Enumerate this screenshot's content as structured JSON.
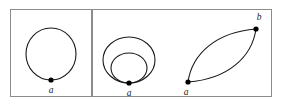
{
  "figure": {
    "title": "",
    "background_color": "#ffffff",
    "curve_color": "#1a1a1a",
    "frame_color": "#8c8c8c",
    "node_color": "#000000",
    "panels": [
      {
        "id": "panel-left",
        "description": "single closed loop based at a point",
        "frame": {
          "x": 10,
          "y": 9,
          "width": 82,
          "height": 88
        },
        "curves": [
          {
            "id": "loop-single",
            "type": "circle",
            "cx": 51,
            "cy": 54,
            "rx": 25,
            "ry": 26
          }
        ],
        "nodes": [
          {
            "id": "node-a-left",
            "label": "a",
            "x": 51,
            "y": 80,
            "radius": 2.6,
            "label_x": 51,
            "label_y": 93,
            "label_anchor": "middle"
          }
        ]
      },
      {
        "id": "panel-right",
        "description": "two tangent loops at a common base point, and a bigon between two points",
        "frame": {
          "x": 92,
          "y": 9,
          "width": 180,
          "height": 88
        },
        "curves": [
          {
            "id": "loop-outer",
            "type": "circle",
            "cx": 129,
            "cy": 60,
            "rx": 26,
            "ry": 23
          },
          {
            "id": "loop-inner",
            "type": "circle",
            "cx": 129,
            "cy": 68,
            "rx": 18,
            "ry": 15
          },
          {
            "id": "bigon-arc-upper",
            "type": "arc",
            "from": {
              "x": 188,
              "y": 82
            },
            "to": {
              "x": 256,
              "y": 29
            },
            "bulge": "upper-left"
          },
          {
            "id": "bigon-arc-lower",
            "type": "arc",
            "from": {
              "x": 188,
              "y": 82
            },
            "to": {
              "x": 256,
              "y": 29
            },
            "bulge": "lower-right"
          }
        ],
        "nodes": [
          {
            "id": "node-a-tangent",
            "label": "a",
            "x": 129,
            "y": 83,
            "radius": 2.6,
            "label_x": 129,
            "label_y": 96,
            "label_anchor": "middle"
          },
          {
            "id": "node-a-bigon",
            "label": "a",
            "x": 188,
            "y": 82,
            "radius": 2.6,
            "label_x": 186,
            "label_y": 95,
            "label_anchor": "middle"
          },
          {
            "id": "node-b-bigon",
            "label": "b",
            "x": 256,
            "y": 29,
            "radius": 2.6,
            "label_x": 259,
            "label_y": 20,
            "label_anchor": "middle"
          }
        ]
      }
    ]
  }
}
